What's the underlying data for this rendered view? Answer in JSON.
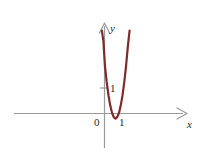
{
  "figure": {
    "background_color": "#ffffff",
    "axis_color": "#9a9a9a",
    "curve_color": "#7f2b2b",
    "label_color": "#2b2b2b"
  },
  "labels": {
    "y_axis_name": "y",
    "x_axis_name": "x",
    "origin": "0",
    "x_tick_one": "1",
    "y_tick_one": "1"
  },
  "chart_data": {
    "type": "line",
    "title": "",
    "xlabel": "x",
    "ylabel": "y",
    "xlim": [
      -1.6,
      2.4
    ],
    "ylim": [
      -0.6,
      3.6
    ],
    "grid": false,
    "legend": null,
    "axis_arrows": [
      "x-positive",
      "y-positive"
    ],
    "xticks": [
      0,
      1
    ],
    "xtick_labels": [
      "0",
      "1"
    ],
    "yticks": [
      1
    ],
    "ytick_labels": [
      "1"
    ],
    "annotations": [],
    "series": [
      {
        "name": "parabola",
        "color": "#7f2b2b",
        "linewidth": 2.2,
        "equation": "y = 9*(x - 0.5)^2 - 0.2",
        "vertex": [
          0.5,
          -0.2
        ],
        "roots": [
          0.35,
          0.65
        ],
        "x": [
          -0.12,
          -0.05,
          0.02,
          0.1,
          0.18,
          0.26,
          0.34,
          0.42,
          0.5,
          0.58,
          0.66,
          0.74,
          0.82,
          0.9,
          0.98,
          1.06,
          1.14
        ],
        "y": [
          3.25,
          2.84,
          1.87,
          1.24,
          0.72,
          0.32,
          0.03,
          -0.14,
          -0.2,
          -0.14,
          0.03,
          0.32,
          0.72,
          1.24,
          1.87,
          2.62,
          3.25
        ]
      }
    ]
  }
}
